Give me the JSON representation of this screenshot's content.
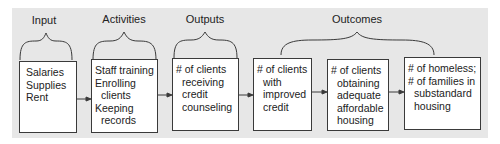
{
  "categories": {
    "input": "Input",
    "activities": "Activities",
    "outputs": "Outputs",
    "outcomes": "Outcomes"
  },
  "boxes": {
    "input": {
      "lines": [
        "Salaries",
        "Supplies",
        "Rent"
      ]
    },
    "activities": {
      "lines": [
        "Staff training",
        "Enrolling",
        "clients",
        "Keeping",
        "records"
      ]
    },
    "outputs": {
      "lines": [
        "# of clients",
        "receiving",
        "credit",
        "counseling"
      ]
    },
    "outcome1": {
      "lines": [
        "# of clients",
        "with",
        "improved",
        "credit"
      ]
    },
    "outcome2": {
      "lines": [
        "# of clients",
        "obtaining",
        "adequate",
        "affordable",
        "housing"
      ]
    },
    "outcome3": {
      "lines": [
        "# of homeless;",
        "# of families in",
        "substandard",
        "housing"
      ]
    }
  },
  "colors": {
    "panel": "#e7e7e7",
    "box_fill": "#ffffff",
    "stroke": "#3a3a3a"
  }
}
